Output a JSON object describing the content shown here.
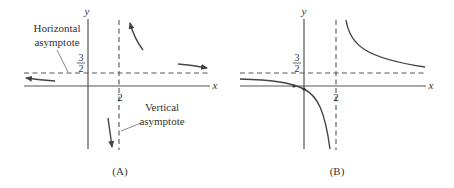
{
  "panels": [
    {
      "id": "A",
      "caption": "(A)",
      "x_axis_label": "x",
      "y_axis_label": "y",
      "x_tick": "2",
      "y_tick_numerator": "3",
      "y_tick_denominator": "2",
      "annotations": {
        "horizontal_line1": "Horizontal",
        "horizontal_line2": "asymptote",
        "vertical_line1": "Vertical",
        "vertical_line2": "asymptote"
      },
      "description": "Asymptotic behavior sketch with arrows near asymptotes x=2 and y=3/2"
    },
    {
      "id": "B",
      "caption": "(B)",
      "x_axis_label": "x",
      "y_axis_label": "y",
      "x_tick": "2",
      "y_tick_numerator": "3",
      "y_tick_denominator": "2",
      "description": "Graph of rational function with vertical asymptote x=2 and horizontal asymptote y=3/2"
    }
  ],
  "asymptotes": {
    "vertical": "x = 2",
    "horizontal": "y = 3/2"
  }
}
